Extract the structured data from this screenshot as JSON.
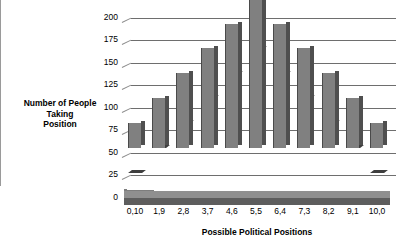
{
  "chart_data": {
    "type": "bar",
    "title": "",
    "xlabel": "Possible Political Positions",
    "ylabel": "Number of People Taking Position",
    "categories": [
      "0,10",
      "1,9",
      "2,8",
      "3,7",
      "4,6",
      "5,5",
      "6,4",
      "7,3",
      "8,2",
      "9,1",
      "10,0"
    ],
    "values": [
      28,
      55,
      83,
      111,
      138,
      165,
      138,
      111,
      83,
      55,
      28
    ],
    "ylim": [
      0,
      200
    ],
    "yticks": [
      0,
      25,
      50,
      75,
      100,
      125,
      150,
      175,
      200
    ],
    "ytick_labels": [
      "0",
      "25",
      "50",
      "75",
      "100",
      "125",
      "150",
      "175",
      "200"
    ],
    "grid": true,
    "legend": "none",
    "style": "3d-column",
    "bar_color": "#808080",
    "bar_side_color": "#4f4f4f",
    "grid_color": "#6e6e6e",
    "floor_color": "#5d5d5d",
    "background": "#ffffff"
  },
  "axes": {
    "y_title_lines": "Number of People\nTaking\nPosition",
    "x_title": "Possible Political Positions"
  }
}
